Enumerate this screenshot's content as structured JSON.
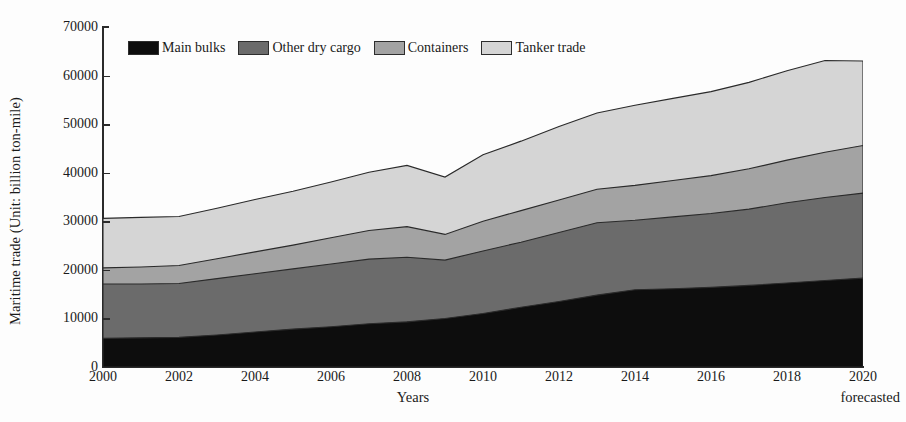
{
  "chart_data": {
    "type": "area",
    "title": "",
    "subtitle": "",
    "xlabel": "Years",
    "ylabel": "Maritime trade (Unit: billion ton-mile)",
    "xlim": [
      2000,
      2020
    ],
    "ylim": [
      0,
      70000
    ],
    "ytick_labels": [
      "0",
      "10000",
      "20000",
      "30000",
      "40000",
      "50000",
      "60000",
      "70000"
    ],
    "ytick_values": [
      0,
      10000,
      20000,
      30000,
      40000,
      50000,
      60000,
      70000
    ],
    "xtick_labels": [
      "2000",
      "2002",
      "2004",
      "2006",
      "2008",
      "2010",
      "2012",
      "2014",
      "2016",
      "2018",
      "2020"
    ],
    "xtick_values": [
      2000,
      2002,
      2004,
      2006,
      2008,
      2010,
      2012,
      2014,
      2016,
      2018,
      2020
    ],
    "grid": false,
    "legend_position": "top-left-inside",
    "stacked": true,
    "annotations": [
      {
        "text": "forecasted",
        "position": "below-axis-right",
        "near_x": 2020
      }
    ],
    "x": [
      2000,
      2001,
      2002,
      2003,
      2004,
      2005,
      2006,
      2007,
      2008,
      2009,
      2010,
      2011,
      2012,
      2013,
      2014,
      2015,
      2016,
      2017,
      2018,
      2019,
      2020
    ],
    "series": [
      {
        "name": "Main bulks",
        "color": "#0d0d0d",
        "values": [
          5900,
          6000,
          6100,
          6600,
          7200,
          7800,
          8300,
          8900,
          9300,
          10000,
          11000,
          12300,
          13500,
          14800,
          15900,
          16100,
          16400,
          16800,
          17300,
          17800,
          18300
        ]
      },
      {
        "name": "Other dry cargo",
        "color": "#6b6b6b",
        "values": [
          11200,
          11100,
          11100,
          11600,
          12000,
          12400,
          12900,
          13300,
          13300,
          12000,
          12900,
          13400,
          14200,
          14900,
          14300,
          14800,
          15200,
          15700,
          16500,
          17100,
          17500
        ]
      },
      {
        "name": "Containers",
        "color": "#a3a3a3",
        "values": [
          3300,
          3500,
          3700,
          4100,
          4500,
          4900,
          5400,
          5900,
          6300,
          5300,
          6100,
          6500,
          6700,
          6900,
          7200,
          7500,
          7800,
          8300,
          8800,
          9300,
          9800
        ]
      },
      {
        "name": "Tanker trade",
        "color": "#d5d5d5",
        "values": [
          10200,
          10200,
          10100,
          10400,
          10800,
          11100,
          11500,
          12000,
          12600,
          11800,
          13700,
          14300,
          15100,
          15700,
          16500,
          16900,
          17300,
          17800,
          18400,
          18900,
          17400
        ]
      }
    ],
    "totals": [
      30600,
      30800,
      31000,
      32700,
      34500,
      36200,
      38100,
      40100,
      41500,
      39100,
      43700,
      46500,
      49500,
      52300,
      53900,
      55300,
      56700,
      58600,
      61000,
      63100,
      63000
    ]
  },
  "legend": {
    "items": [
      {
        "label": "Main bulks",
        "color": "#0d0d0d"
      },
      {
        "label": "Other dry cargo",
        "color": "#6b6b6b"
      },
      {
        "label": "Containers",
        "color": "#a3a3a3"
      },
      {
        "label": "Tanker trade",
        "color": "#d5d5d5"
      }
    ]
  },
  "axes": {
    "y_title": "Maritime trade (Unit: billion ton-mile)",
    "x_title": "Years",
    "forecast_note": "forecasted"
  }
}
